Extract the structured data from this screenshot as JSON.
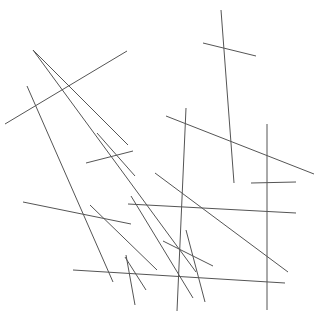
{
  "figure": {
    "title": "",
    "background_color": "#ffffff",
    "stroke_color": "#555555",
    "stroke_width": 1,
    "width": 316,
    "height": 317
  },
  "chart_data": {
    "type": "scatter",
    "title": "",
    "subtitle": "",
    "xlabel": "",
    "ylabel": "",
    "xlim": [
      0,
      316
    ],
    "ylim": [
      0,
      317
    ],
    "grid": false,
    "legend": null,
    "annotations": [],
    "xticks": [],
    "yticks": [],
    "series": [
      {
        "name": "line-segments",
        "count": 22,
        "segments": [
          {
            "id": 1,
            "x1": 33,
            "y1": 50,
            "x2": 128,
            "y2": 145,
            "orientation": "diagonal-down-right"
          },
          {
            "id": 2,
            "x1": 5,
            "y1": 124,
            "x2": 127,
            "y2": 51,
            "orientation": "diagonal-up-right"
          },
          {
            "id": 3,
            "x1": 27,
            "y1": 86,
            "x2": 113,
            "y2": 282,
            "orientation": "steep-down-right"
          },
          {
            "id": 4,
            "x1": 33,
            "y1": 50,
            "x2": 196,
            "y2": 272,
            "orientation": "diagonal-down-right"
          },
          {
            "id": 5,
            "x1": 97,
            "y1": 133,
            "x2": 135,
            "y2": 176,
            "orientation": "steep-down-right"
          },
          {
            "id": 6,
            "x1": 86,
            "y1": 163,
            "x2": 133,
            "y2": 151,
            "orientation": "shallow-up-right"
          },
          {
            "id": 7,
            "x1": 221,
            "y1": 10,
            "x2": 234,
            "y2": 183,
            "orientation": "near-vertical"
          },
          {
            "id": 8,
            "x1": 203,
            "y1": 43,
            "x2": 256,
            "y2": 56,
            "orientation": "shallow-down-right"
          },
          {
            "id": 9,
            "x1": 166,
            "y1": 116,
            "x2": 314,
            "y2": 174,
            "orientation": "shallow-down-right"
          },
          {
            "id": 10,
            "x1": 186,
            "y1": 108,
            "x2": 177,
            "y2": 311,
            "orientation": "near-vertical"
          },
          {
            "id": 11,
            "x1": 267,
            "y1": 124,
            "x2": 267,
            "y2": 310,
            "orientation": "vertical"
          },
          {
            "id": 12,
            "x1": 251,
            "y1": 183,
            "x2": 296,
            "y2": 182,
            "orientation": "horizontal"
          },
          {
            "id": 13,
            "x1": 23,
            "y1": 202,
            "x2": 131,
            "y2": 224,
            "orientation": "shallow-down-right"
          },
          {
            "id": 14,
            "x1": 128,
            "y1": 204,
            "x2": 296,
            "y2": 213,
            "orientation": "horizontal"
          },
          {
            "id": 15,
            "x1": 73,
            "y1": 270,
            "x2": 285,
            "y2": 283,
            "orientation": "horizontal"
          },
          {
            "id": 16,
            "x1": 90,
            "y1": 205,
            "x2": 157,
            "y2": 270,
            "orientation": "diagonal-down-right"
          },
          {
            "id": 17,
            "x1": 126,
            "y1": 255,
            "x2": 135,
            "y2": 305,
            "orientation": "near-vertical"
          },
          {
            "id": 18,
            "x1": 125,
            "y1": 257,
            "x2": 146,
            "y2": 290,
            "orientation": "steep-down-right"
          },
          {
            "id": 19,
            "x1": 163,
            "y1": 241,
            "x2": 213,
            "y2": 266,
            "orientation": "diagonal-down-right"
          },
          {
            "id": 20,
            "x1": 186,
            "y1": 230,
            "x2": 205,
            "y2": 302,
            "orientation": "steep-down-right"
          },
          {
            "id": 21,
            "x1": 155,
            "y1": 173,
            "x2": 288,
            "y2": 272,
            "orientation": "diagonal-down-right"
          },
          {
            "id": 22,
            "x1": 131,
            "y1": 196,
            "x2": 193,
            "y2": 298,
            "orientation": "steep-down-right"
          }
        ]
      }
    ]
  }
}
